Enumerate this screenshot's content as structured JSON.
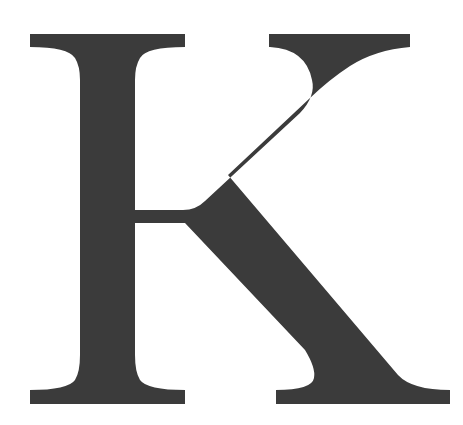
{
  "image": {
    "letter": "K",
    "description": "Large serif capital letter K",
    "colors": {
      "glyph": "#3b3b3b",
      "background": "#ffffff"
    }
  }
}
